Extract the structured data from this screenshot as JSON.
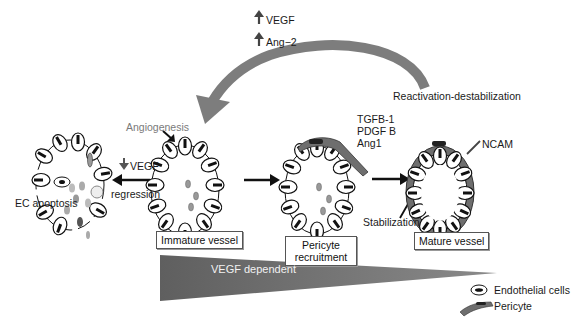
{
  "figure": {
    "factors_top": [
      {
        "direction": "up",
        "label": "VEGF"
      },
      {
        "direction": "up",
        "label": "Ang−2"
      }
    ],
    "curved_arrow_label": "Reactivation-destabilization",
    "angiogenesis_label": "Angiogenesis",
    "regression": {
      "factor_direction": "down",
      "factor_label": "VEGF",
      "label": "regression"
    },
    "ec_apoptosis_label": "EC apoptosis",
    "stages": [
      {
        "id": "immature",
        "label": "Immature vessel"
      },
      {
        "id": "pericyte",
        "label_line1": "Pericyte",
        "label_line2": "recruitment"
      },
      {
        "id": "mature",
        "label": "Mature vessel"
      }
    ],
    "recruitment_factors": [
      "TGFB-1",
      "PDGF B",
      "Ang1"
    ],
    "stabilization_label": "Stabilization",
    "ncam_label": "NCAM",
    "gradient_label": "VEGF dependent",
    "legend": [
      {
        "symbol": "endothelial-cell",
        "label": "Endothelial cells"
      },
      {
        "symbol": "pericyte",
        "label": "Pericyte"
      }
    ],
    "colors": {
      "arrow_gray": "#7d7d7d",
      "pericyte_gray": "#6e6e6e",
      "triangle_gray": "#6b6b6b",
      "text_gray": "#7a7a7a"
    }
  }
}
